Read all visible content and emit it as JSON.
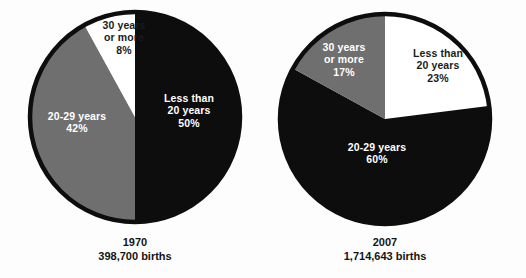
{
  "colors": {
    "background": "#fdfdfd",
    "dark_slice": "#0d0d0d",
    "gray_slice": "#6f6f6f",
    "light_slice": "#ffffff",
    "outline": "#0d0d0d",
    "dark_text": "#1b1b1b",
    "light_text": "#ffffff"
  },
  "credit": "Courtesy of CDC/NCHS, National Vital Statistics System",
  "chart_data": [
    {
      "type": "pie",
      "title": "1970",
      "subtitle": "398,700 births",
      "categories": [
        "Less than 20 years",
        "20-29 years",
        "30 years or more"
      ],
      "values": [
        50,
        42,
        8
      ],
      "value_labels": [
        "50%",
        "42%",
        "8%"
      ],
      "colors": [
        "#0d0d0d",
        "#6f6f6f",
        "#ffffff"
      ],
      "start_angle_deg": 0,
      "direction": "clockwise",
      "legend": "none",
      "labels_inside": true,
      "slices": [
        {
          "name": "less-than-20-years",
          "line1": "Less than",
          "line2": "20 years",
          "pct": "50%",
          "fill": "#0d0d0d",
          "text_color": "#ffffff"
        },
        {
          "name": "20-29-years",
          "line1": "20-29 years",
          "line2": "",
          "pct": "42%",
          "fill": "#6f6f6f",
          "text_color": "#ffffff"
        },
        {
          "name": "30-years-or-more",
          "line1": "30 years",
          "line2": "or more",
          "pct": "8%",
          "fill": "#ffffff",
          "text_color": "#1b1b1b"
        }
      ]
    },
    {
      "type": "pie",
      "title": "2007",
      "subtitle": "1,714,643 births",
      "categories": [
        "Less than 20 years",
        "20-29 years",
        "30 years or more"
      ],
      "values": [
        23,
        60,
        17
      ],
      "value_labels": [
        "23%",
        "60%",
        "17%"
      ],
      "colors": [
        "#ffffff",
        "#0d0d0d",
        "#6f6f6f"
      ],
      "start_angle_deg": 0,
      "direction": "clockwise",
      "legend": "none",
      "labels_inside": true,
      "slices": [
        {
          "name": "less-than-20-years",
          "line1": "Less than",
          "line2": "20 years",
          "pct": "23%",
          "fill": "#ffffff",
          "text_color": "#1b1b1b"
        },
        {
          "name": "20-29-years",
          "line1": "20-29 years",
          "line2": "",
          "pct": "60%",
          "fill": "#0d0d0d",
          "text_color": "#ffffff"
        },
        {
          "name": "30-years-or-more",
          "line1": "30 years",
          "line2": "or more",
          "pct": "17%",
          "fill": "#6f6f6f",
          "text_color": "#ffffff"
        }
      ]
    }
  ]
}
